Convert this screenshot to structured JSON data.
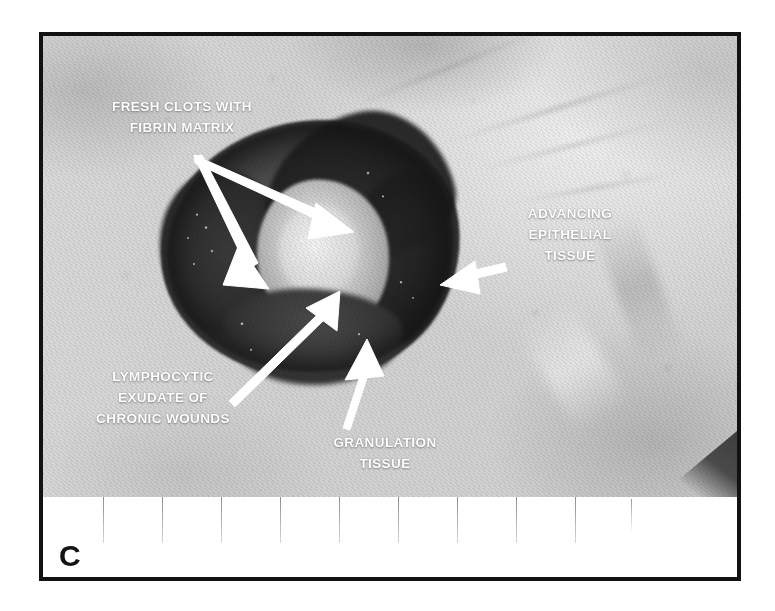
{
  "figure": {
    "panel_letter": "C",
    "type": "clinical-photograph",
    "frame_color": "#121212",
    "annotation_color": "#ffffff"
  },
  "annotations": [
    {
      "id": "fresh-clots",
      "lines": [
        "FRESH CLOTS WITH",
        "FIBRIN MATRIX"
      ],
      "line1": "FRESH CLOTS WITH",
      "line2": "FIBRIN MATRIX",
      "align": "center",
      "arrows": 2,
      "arrow_direction": "down-right"
    },
    {
      "id": "advancing-epithelial",
      "lines": [
        "ADVANCING",
        "EPITHELIAL",
        "TISSUE"
      ],
      "line1": "ADVANCING",
      "line2": "EPITHELIAL",
      "line3": "TISSUE",
      "align": "center",
      "arrows": 1,
      "arrow_direction": "left"
    },
    {
      "id": "lymphocytic-exudate",
      "lines": [
        "LYMPHOCYTIC",
        "EXUDATE OF",
        "CHRONIC WOUNDS"
      ],
      "line1": "LYMPHOCYTIC",
      "line2": "EXUDATE OF",
      "line3": "CHRONIC WOUNDS",
      "align": "center",
      "arrows": 1,
      "arrow_direction": "up-right"
    },
    {
      "id": "granulation-tissue",
      "lines": [
        "GRANULATION",
        "TISSUE"
      ],
      "line1": "GRANULATION",
      "line2": "TISSUE",
      "align": "center",
      "arrows": 1,
      "arrow_direction": "up"
    }
  ],
  "ruler": {
    "present": true,
    "tick_count": 9,
    "tick_spacing_px": 59,
    "first_tick_x": 60,
    "background": "#ffffff",
    "tick_color": "#9a9a9a"
  }
}
